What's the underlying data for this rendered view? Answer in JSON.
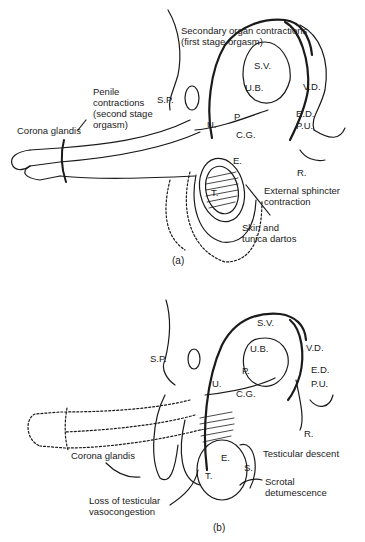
{
  "panel_a": {
    "caption": "(a)",
    "labels": {
      "secondary_organ": "Secondary organ contractions\n(first stage orgasm)",
      "penile_contractions": "Penile\ncontractions\n(second stage\norgasm)",
      "corona_glandis": "Corona glandis",
      "sp": "S.P.",
      "sv": "S.V.",
      "ub": "U.B.",
      "vd": "V.D.",
      "p": "P.",
      "ed": "E.D.",
      "u": "U.",
      "cg": "C.G.",
      "pu": "P.U.",
      "e": "E.",
      "r": "R.",
      "t": "T.",
      "external_sphincter": "External sphincter\ncontraction",
      "skin_tunica": "Skin and\ntunica dartos"
    }
  },
  "panel_b": {
    "caption": "(b)",
    "labels": {
      "sp": "S.P.",
      "sv": "S.V.",
      "ub": "U.B.",
      "vd": "V.D.",
      "p": "P.",
      "ed": "E.D.",
      "u": "U.",
      "cg": "C.G.",
      "pu": "P.U.",
      "r": "R.",
      "corona_glandis": "Corona glandis",
      "e": "E.",
      "s": "S.",
      "t": "T.",
      "testicular_descent": "Testicular descent",
      "scrotal_detumescence": "Scrotal\ndetumescence",
      "loss_vasocongestion": "Loss of testicular\nvasocongestion"
    }
  }
}
